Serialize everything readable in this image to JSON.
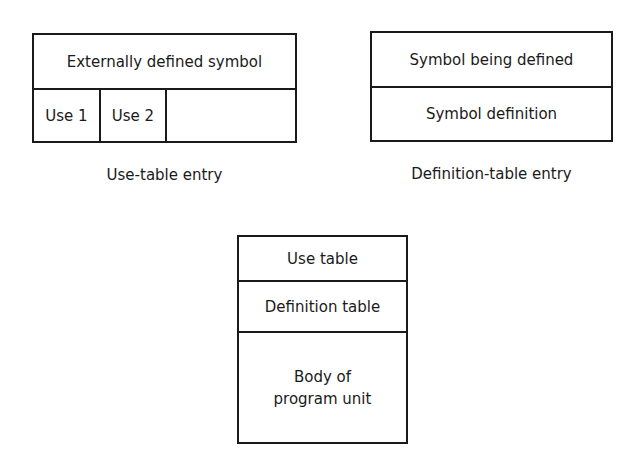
{
  "use_table_entry": {
    "header": "Externally defined symbol",
    "cells": [
      "Use 1",
      "Use 2",
      ""
    ],
    "caption": "Use-table entry"
  },
  "definition_table_entry": {
    "rows": [
      "Symbol being defined",
      "Symbol definition"
    ],
    "caption": "Definition-table entry"
  },
  "program_unit": {
    "rows": [
      "Use table",
      "Definition table",
      "Body of\nprogram unit"
    ]
  }
}
